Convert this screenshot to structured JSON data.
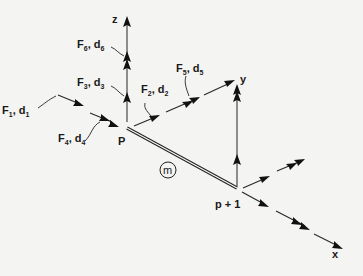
{
  "diagram": {
    "type": "3D beam element force/displacement coordinate diagram",
    "axes": {
      "z": "z",
      "y": "y",
      "x": "x"
    },
    "nodes": {
      "start": "P",
      "end": "p + 1"
    },
    "member": {
      "label": "m"
    },
    "force_labels": [
      {
        "F": "F",
        "fsub": "1",
        "d": "d",
        "dsub": "1"
      },
      {
        "F": "F",
        "fsub": "2",
        "d": "d",
        "dsub": "2"
      },
      {
        "F": "F",
        "fsub": "3",
        "d": "d",
        "dsub": "3"
      },
      {
        "F": "F",
        "fsub": "4",
        "d": "d",
        "dsub": "4"
      },
      {
        "F": "F",
        "fsub": "5",
        "d": "d",
        "dsub": "5"
      },
      {
        "F": "F",
        "fsub": "6",
        "d": "d",
        "dsub": "6"
      }
    ],
    "colors": {
      "background": "#f4f4f2",
      "ink": "#1a1a1a",
      "axis_line": "#555555"
    }
  }
}
